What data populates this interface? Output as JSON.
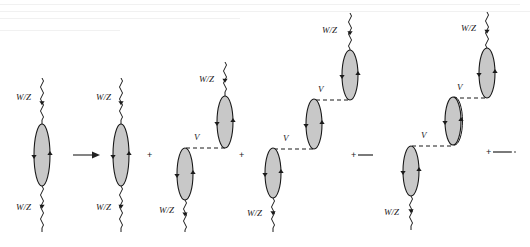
{
  "figure": {
    "labels": {
      "boson": "W/Z",
      "interaction": "V",
      "plus": "+"
    },
    "colors": {
      "bubble_fill": "#c8c8c8",
      "line": "#1a1a1a",
      "background": "#ffffff"
    },
    "terms": [
      {
        "id": "lhs",
        "bubbles": [
          {
            "cx": 42,
            "cy": 155,
            "rx": 8,
            "ry": 31
          }
        ],
        "wavy_top": {
          "x": 42,
          "y1": 78,
          "y2": 124
        },
        "wavy_bottom": {
          "x": 42,
          "y1": 186,
          "y2": 232
        },
        "boson_labels": [
          {
            "x": 16,
            "y": 100
          },
          {
            "x": 16,
            "y": 210
          }
        ],
        "v_labels": [],
        "dashes": []
      },
      {
        "id": "term-1",
        "bubbles": [
          {
            "cx": 121,
            "cy": 155,
            "rx": 8,
            "ry": 31
          }
        ],
        "wavy_top": {
          "x": 121,
          "y1": 78,
          "y2": 124
        },
        "wavy_bottom": {
          "x": 121,
          "y1": 186,
          "y2": 232
        },
        "boson_labels": [
          {
            "x": 96,
            "y": 100
          },
          {
            "x": 96,
            "y": 210
          }
        ],
        "v_labels": [],
        "dashes": []
      },
      {
        "id": "term-2",
        "bubbles": [
          {
            "cx": 225,
            "cy": 122,
            "rx": 8,
            "ry": 26
          },
          {
            "cx": 185,
            "cy": 174,
            "rx": 8,
            "ry": 26
          }
        ],
        "wavy_top": {
          "x": 225,
          "y1": 62,
          "y2": 96
        },
        "wavy_bottom": {
          "x": 185,
          "y1": 200,
          "y2": 232
        },
        "boson_labels": [
          {
            "x": 199,
            "y": 82
          },
          {
            "x": 159,
            "y": 213
          }
        ],
        "v_labels": [
          {
            "x": 194,
            "y": 140
          }
        ],
        "dashes": [
          {
            "x1": 186,
            "x2": 225,
            "y": 148
          }
        ]
      },
      {
        "id": "term-3",
        "bubbles": [
          {
            "cx": 350,
            "cy": 75,
            "rx": 8,
            "ry": 25
          },
          {
            "cx": 314,
            "cy": 124,
            "rx": 8,
            "ry": 25
          },
          {
            "cx": 273,
            "cy": 173,
            "rx": 8,
            "ry": 25
          }
        ],
        "wavy_top": {
          "x": 350,
          "y1": 13,
          "y2": 50
        },
        "wavy_bottom": {
          "x": 273,
          "y1": 198,
          "y2": 232
        },
        "boson_labels": [
          {
            "x": 322,
            "y": 33
          },
          {
            "x": 247,
            "y": 216
          }
        ],
        "v_labels": [
          {
            "x": 318,
            "y": 92
          },
          {
            "x": 283,
            "y": 141
          }
        ],
        "dashes": [
          {
            "x1": 316,
            "x2": 350,
            "y": 100
          },
          {
            "x1": 274,
            "x2": 314,
            "y": 149
          }
        ]
      },
      {
        "id": "term-4",
        "bubbles": [
          {
            "cx": 487,
            "cy": 73,
            "rx": 8,
            "ry": 25
          },
          {
            "cx": 453,
            "cy": 121,
            "rx": 8,
            "ry": 24,
            "double": true
          },
          {
            "cx": 411,
            "cy": 171,
            "rx": 8,
            "ry": 25
          }
        ],
        "wavy_top": {
          "x": 487,
          "y1": 12,
          "y2": 48
        },
        "wavy_bottom": {
          "x": 411,
          "y1": 196,
          "y2": 230
        },
        "boson_labels": [
          {
            "x": 461,
            "y": 31
          },
          {
            "x": 384,
            "y": 215
          }
        ],
        "v_labels": [
          {
            "x": 457,
            "y": 90
          },
          {
            "x": 421,
            "y": 138
          }
        ],
        "dashes": [
          {
            "x1": 453,
            "x2": 487,
            "y": 98
          },
          {
            "x1": 412,
            "x2": 453,
            "y": 146
          }
        ]
      }
    ],
    "arrow": {
      "x1": 73,
      "x2": 100,
      "y": 155
    },
    "plus_signs": [
      {
        "x": 150,
        "y": 155,
        "trail": null
      },
      {
        "x": 242,
        "y": 155,
        "trail": null
      },
      {
        "x": 354,
        "y": 155,
        "trail": {
          "x2": 373,
          "dotted_end": false
        }
      },
      {
        "x": 489,
        "y": 152,
        "trail": {
          "x2": 512,
          "dotted_end": true
        }
      }
    ]
  }
}
